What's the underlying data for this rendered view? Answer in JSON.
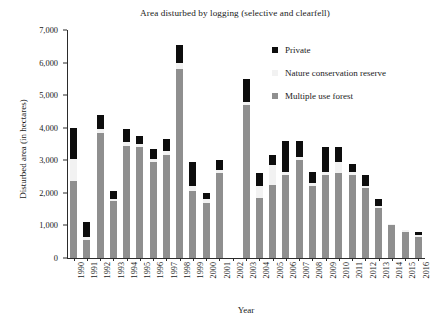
{
  "chart_data": {
    "type": "bar",
    "stacked": true,
    "title": "Area disturbed by logging (selective and clearfell)",
    "xlabel": "Year",
    "ylabel": "Disturbed area (in hectares)",
    "grid": false,
    "legend_position": "top-right",
    "ylim": [
      0,
      7000
    ],
    "yticks": [
      0,
      1000,
      2000,
      3000,
      4000,
      5000,
      6000,
      7000
    ],
    "ytick_labels": [
      "0",
      "1,000",
      "2,000",
      "3,000",
      "4,000",
      "5,000",
      "6,000",
      "7,000"
    ],
    "categories": [
      "1990",
      "1991",
      "1992",
      "1993",
      "1994",
      "1995",
      "1996",
      "1997",
      "1998",
      "1999",
      "2000",
      "2001",
      "2002",
      "2003",
      "2004",
      "2005",
      "2006",
      "2007",
      "2008",
      "2009",
      "2010",
      "2011",
      "2012",
      "2013",
      "2014",
      "2015",
      "2016"
    ],
    "series": [
      {
        "name": "Multiple use forest",
        "color": "#8f8f8f",
        "values": [
          2350,
          550,
          3850,
          1750,
          3450,
          3400,
          2950,
          3150,
          5800,
          2050,
          1700,
          2600,
          0,
          4700,
          1850,
          2250,
          2550,
          3000,
          2200,
          2550,
          2600,
          2550,
          2150,
          1550,
          1000,
          800,
          650
        ]
      },
      {
        "name": "Nature conservation reserve",
        "color": "#f2f2f2",
        "values": [
          700,
          100,
          100,
          50,
          100,
          100,
          100,
          150,
          200,
          150,
          100,
          100,
          0,
          100,
          350,
          600,
          100,
          100,
          100,
          100,
          350,
          100,
          50,
          50,
          50,
          50,
          50
        ]
      },
      {
        "name": "Private",
        "color": "#0d0d0d",
        "values": [
          950,
          450,
          450,
          250,
          400,
          250,
          300,
          350,
          550,
          750,
          200,
          300,
          0,
          700,
          400,
          300,
          950,
          500,
          350,
          750,
          450,
          250,
          350,
          200,
          0,
          0,
          100
        ]
      }
    ]
  },
  "legend": {
    "items": [
      {
        "label": "Private",
        "color": "#0d0d0d"
      },
      {
        "label": "Nature conservation reserve",
        "color": "#f2f2f2"
      },
      {
        "label": "Multiple use forest",
        "color": "#8f8f8f"
      }
    ]
  }
}
